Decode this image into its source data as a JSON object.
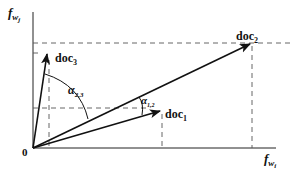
{
  "axes": {
    "y_label": "f",
    "y_sub": "w",
    "y_subsub": "j",
    "x_label": "f",
    "x_sub": "w",
    "x_subsub": "i",
    "origin_label": "0"
  },
  "vectors": [
    {
      "name": "doc1",
      "label": "doc",
      "sub": "1"
    },
    {
      "name": "doc2",
      "label": "doc",
      "sub": "2"
    },
    {
      "name": "doc3",
      "label": "doc",
      "sub": "3"
    }
  ],
  "angles": [
    {
      "name": "alpha-1-2",
      "symbol": "α",
      "sub": "1,2"
    },
    {
      "name": "alpha-2-3",
      "symbol": "α",
      "sub": "2,3"
    }
  ],
  "colors": {
    "stroke": "#111111",
    "dash": "#555555"
  }
}
